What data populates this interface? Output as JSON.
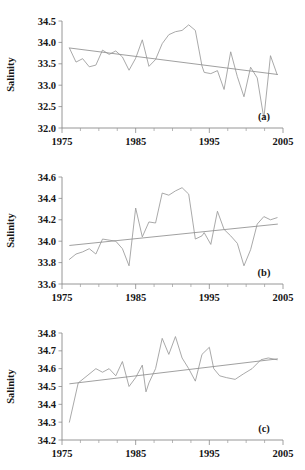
{
  "figure": {
    "width": 305,
    "height": 470,
    "background": "#ffffff",
    "line_color": "#9a9a9a",
    "trend_color": "#8f8f8f",
    "axis_color": "#8a8a8a",
    "text_color": "#161616"
  },
  "chart_data": [
    {
      "type": "line",
      "panel": "a",
      "tag": "(a)",
      "title": "",
      "xlabel": "",
      "ylabel": "Salinity",
      "xlim": [
        1975,
        2005
      ],
      "ylim": [
        32.0,
        34.5
      ],
      "xticks": [
        1975,
        1985,
        1995,
        2005
      ],
      "xtick_labels": [
        "1975",
        "1985",
        "1995",
        "2005"
      ],
      "xminor_step": 2.5,
      "yticks": [
        32.0,
        32.5,
        33.0,
        33.5,
        34.0,
        34.5
      ],
      "ytick_labels": [
        "32.0",
        "32.5",
        "33.0",
        "33.5",
        "34.0",
        "34.5"
      ],
      "grid": false,
      "legend": null,
      "x": [
        1976,
        1977,
        1978,
        1979,
        1980,
        1981,
        1982,
        1983,
        1984,
        1985,
        1986,
        1987,
        1988,
        1989,
        1990,
        1991,
        1992,
        1993,
        1994,
        1995,
        1996,
        1997,
        1998,
        1999,
        2000,
        2001,
        2002,
        2003,
        2004
      ],
      "values": [
        33.87,
        33.54,
        33.62,
        33.43,
        33.47,
        33.82,
        33.72,
        33.8,
        33.66,
        33.35,
        33.63,
        34.06,
        33.44,
        33.97,
        34.13,
        34.22,
        34.25,
        34.41,
        34.2,
        33.45,
        33.3,
        33.27,
        33.34,
        32.9,
        33.78,
        33.2,
        32.73,
        33.42,
        33.17,
        32.23,
        33.69,
        33.25
      ],
      "series": [
        {
          "name": "Salinity",
          "x": [
            1976,
            1976.9,
            1977.8,
            1978.7,
            1979.6,
            1980.5,
            1981.4,
            1982.3,
            1983.2,
            1984.1,
            1985.0,
            1985.9,
            1986.8,
            1987.7,
            1988.6,
            1989.5,
            1990.4,
            1991.3,
            1992.2,
            1993.1,
            1994.0,
            1994.3,
            1995.2,
            1996.1,
            1997.0,
            1997.9,
            1998.8,
            1999.7,
            2000.6,
            2001.5,
            2002.4,
            2003.3,
            2004.2
          ],
          "values": [
            33.87,
            33.54,
            33.62,
            33.43,
            33.47,
            33.82,
            33.72,
            33.8,
            33.66,
            33.35,
            33.63,
            34.06,
            33.44,
            33.6,
            33.97,
            34.18,
            34.25,
            34.28,
            34.41,
            34.28,
            33.45,
            33.3,
            33.27,
            33.34,
            32.9,
            33.78,
            33.2,
            32.73,
            33.42,
            33.17,
            32.23,
            33.69,
            33.25
          ]
        }
      ],
      "trend": {
        "x": [
          1976,
          2004.3
        ],
        "y": [
          33.87,
          33.25
        ],
        "direction": "decreasing"
      }
    },
    {
      "type": "line",
      "panel": "b",
      "tag": "(b)",
      "title": "",
      "xlabel": "",
      "ylabel": "Salinity",
      "xlim": [
        1975,
        2005
      ],
      "ylim": [
        33.6,
        34.6
      ],
      "xticks": [
        1975,
        1985,
        1995,
        2005
      ],
      "xtick_labels": [
        "1975",
        "1985",
        "1995",
        "2005"
      ],
      "xminor_step": 2.5,
      "yticks": [
        33.6,
        33.8,
        34.0,
        34.2,
        34.4,
        34.6
      ],
      "ytick_labels": [
        "33.6",
        "33.8",
        "34.0",
        "34.2",
        "34.4",
        "34.6"
      ],
      "grid": false,
      "legend": null,
      "series": [
        {
          "name": "Salinity",
          "x": [
            1976,
            1976.9,
            1977.8,
            1978.7,
            1979.6,
            1980.5,
            1981.4,
            1982.3,
            1983.2,
            1984.1,
            1985.0,
            1985.9,
            1986.8,
            1987.7,
            1988.6,
            1989.5,
            1990.4,
            1991.3,
            1992.2,
            1993.1,
            1994.0,
            1994.3,
            1995.2,
            1996.1,
            1997.0,
            1997.9,
            1998.8,
            1999.7,
            2000.6,
            2001.5,
            2002.4,
            2003.3,
            2004.2
          ],
          "values": [
            33.83,
            33.88,
            33.9,
            33.93,
            33.88,
            34.02,
            34.01,
            34.0,
            33.93,
            33.77,
            34.31,
            34.04,
            34.18,
            34.17,
            34.45,
            34.43,
            34.47,
            34.5,
            34.44,
            34.02,
            34.05,
            34.08,
            33.97,
            34.28,
            34.11,
            34.05,
            33.98,
            33.77,
            33.92,
            34.16,
            34.23,
            34.2,
            34.22
          ]
        }
      ],
      "trend": {
        "x": [
          1976,
          2004.3
        ],
        "y": [
          33.96,
          34.16
        ],
        "direction": "increasing"
      }
    },
    {
      "type": "line",
      "panel": "c",
      "tag": "(c)",
      "title": "",
      "xlabel": "",
      "ylabel": "Salinity",
      "xlim": [
        1975,
        2005
      ],
      "ylim": [
        34.2,
        34.8
      ],
      "xticks": [
        1975,
        1985,
        1995,
        2005
      ],
      "xtick_labels": [
        "1975",
        "1985",
        "1995",
        "2005"
      ],
      "xminor_step": 2.5,
      "yticks": [
        34.2,
        34.3,
        34.4,
        34.5,
        34.6,
        34.7,
        34.8
      ],
      "ytick_labels": [
        "34.2",
        "34.3",
        "34.4",
        "34.5",
        "34.6",
        "34.7",
        "34.8"
      ],
      "grid": false,
      "legend": null,
      "series": [
        {
          "name": "Salinity",
          "x": [
            1976,
            1977.2,
            1978.4,
            1979.6,
            1980.5,
            1981.4,
            1982.3,
            1983.2,
            1984.1,
            1985.0,
            1985.9,
            1986.4,
            1986.8,
            1987.7,
            1988.6,
            1989.5,
            1990.4,
            1991.3,
            1992.2,
            1993.1,
            1994.0,
            1995.0,
            1995.6,
            1996.4,
            1997.3,
            1998.5,
            1999.6,
            2000.8,
            2002.0,
            2003.0,
            2004.2
          ],
          "values": [
            34.3,
            34.52,
            34.56,
            34.6,
            34.58,
            34.6,
            34.56,
            34.64,
            34.5,
            34.55,
            34.62,
            34.47,
            34.52,
            34.6,
            34.77,
            34.68,
            34.78,
            34.66,
            34.6,
            34.53,
            34.68,
            34.72,
            34.6,
            34.56,
            34.55,
            34.54,
            34.57,
            34.6,
            34.65,
            34.66,
            34.65
          ]
        }
      ],
      "trend": {
        "x": [
          1976,
          2004.3
        ],
        "y": [
          34.515,
          34.655
        ],
        "direction": "increasing"
      }
    }
  ]
}
